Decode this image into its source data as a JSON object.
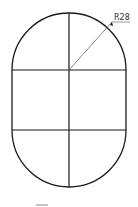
{
  "diagram": {
    "type": "obround-with-grid",
    "colors": {
      "background": "#ffffff",
      "outline": "#1a1a1a",
      "leader": "#555555",
      "text": "#333333",
      "mark": "#888888"
    },
    "dimension": {
      "label": "R28"
    }
  }
}
